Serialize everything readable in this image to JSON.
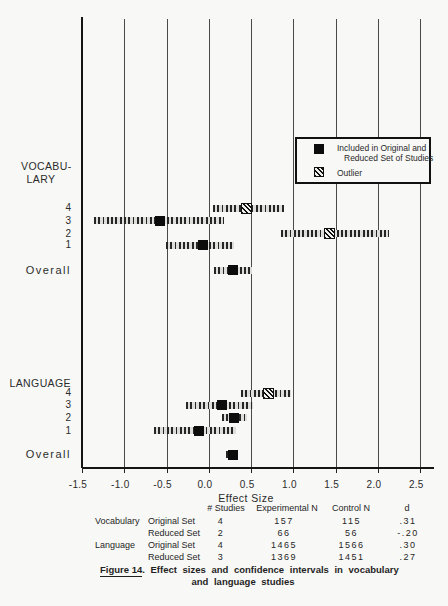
{
  "chart_data": {
    "type": "interval",
    "xlabel": "Effect Size",
    "xlim": [
      -1.5,
      2.5
    ],
    "x_ticks": [
      -1.5,
      -1.0,
      -0.5,
      0.0,
      0.5,
      1.0,
      1.5,
      2.0,
      2.5
    ],
    "grid": "vertical-lines-at-each-tick",
    "legend": {
      "position": "upper-right-box",
      "items": [
        {
          "marker": "filled-square",
          "label_line1": "Included in Original and",
          "label_line2": "Reduced Set of Studies"
        },
        {
          "marker": "hatched-square",
          "label_line1": "Outlier",
          "label_line2": ""
        }
      ]
    },
    "groups": [
      {
        "name": "VOCABULARY",
        "display_lines": [
          "VOCABU-",
          "LARY"
        ],
        "rows": [
          {
            "label": "4",
            "ci_low": 0.05,
            "ci_high": 0.89,
            "estimate": 0.44,
            "outlier": true
          },
          {
            "label": "3",
            "ci_low": -1.36,
            "ci_high": 0.18,
            "estimate": -0.58,
            "outlier": false
          },
          {
            "label": "2",
            "ci_low": 0.85,
            "ci_high": 2.13,
            "estimate": 1.43,
            "outlier": true
          },
          {
            "label": "1",
            "ci_low": -0.51,
            "ci_high": 0.3,
            "estimate": -0.07,
            "outlier": false
          },
          {
            "label": "Overall",
            "ci_low": 0.06,
            "ci_high": 0.51,
            "estimate": 0.28,
            "outlier": false
          }
        ]
      },
      {
        "name": "LANGUAGE",
        "display_lines": [
          "LANGUAGE"
        ],
        "rows": [
          {
            "label": "4",
            "ci_low": 0.38,
            "ci_high": 0.97,
            "estimate": 0.7,
            "outlier": true
          },
          {
            "label": "3",
            "ci_low": -0.27,
            "ci_high": 0.52,
            "estimate": 0.15,
            "outlier": false
          },
          {
            "label": "2",
            "ci_low": 0.16,
            "ci_high": 0.45,
            "estimate": 0.3,
            "outlier": false
          },
          {
            "label": "1",
            "ci_low": -0.65,
            "ci_high": 0.32,
            "estimate": -0.12,
            "outlier": false
          },
          {
            "label": "Overall",
            "ci_low": 0.2,
            "ci_high": 0.35,
            "estimate": 0.28,
            "outlier": false
          }
        ]
      }
    ]
  },
  "summary_table": {
    "col_headers": [
      "# Studies",
      "Experimental N",
      "Control N",
      "d"
    ],
    "rows": [
      {
        "group": "Vocabulary",
        "set": "Original Set",
        "n_studies": "4",
        "experimental_n": "157",
        "control_n": "115",
        "d": ".31"
      },
      {
        "group": "",
        "set": "Reduced Set",
        "n_studies": "2",
        "experimental_n": "66",
        "control_n": "56",
        "d": "-.20"
      },
      {
        "group": "Language",
        "set": "Original Set",
        "n_studies": "4",
        "experimental_n": "1465",
        "control_n": "1566",
        "d": ".30"
      },
      {
        "group": "",
        "set": "Reduced Set",
        "n_studies": "3",
        "experimental_n": "1369",
        "control_n": "1451",
        "d": ".27"
      }
    ]
  },
  "caption": {
    "figure_label": "Figure 14",
    "line1_rest": ".  Effect sizes and confidence intervals in vocabulary",
    "line2": "and language studies"
  },
  "colors": {
    "paper": "#f8f8f6",
    "ink": "#1a1a1a",
    "grid": "#4a4a4a"
  }
}
